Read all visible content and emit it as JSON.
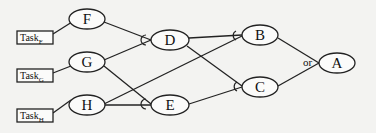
{
  "diagram": {
    "type": "and-or goal tree",
    "tasks": [
      {
        "id": "task_f",
        "label": "Task",
        "subscript": "F"
      },
      {
        "id": "task_g",
        "label": "Task",
        "subscript": "G"
      },
      {
        "id": "task_h",
        "label": "Task",
        "subscript": "H"
      }
    ],
    "nodes": {
      "F": "F",
      "G": "G",
      "H": "H",
      "D": "D",
      "E": "E",
      "B": "B",
      "C": "C",
      "A": "A"
    },
    "edges": [
      {
        "from": "Task_F",
        "to": "F"
      },
      {
        "from": "Task_G",
        "to": "G"
      },
      {
        "from": "Task_H",
        "to": "H"
      },
      {
        "from": "F",
        "to": "D",
        "join": "and"
      },
      {
        "from": "G",
        "to": "D",
        "join": "and"
      },
      {
        "from": "G",
        "to": "E",
        "join": "and"
      },
      {
        "from": "H",
        "to": "E",
        "join": "and"
      },
      {
        "from": "H",
        "to": "B",
        "join": "and"
      },
      {
        "from": "D",
        "to": "B",
        "join": "and"
      },
      {
        "from": "D",
        "to": "C",
        "join": "and"
      },
      {
        "from": "E",
        "to": "C",
        "join": "and"
      },
      {
        "from": "B",
        "to": "A",
        "join": "or"
      },
      {
        "from": "C",
        "to": "A",
        "join": "or"
      }
    ],
    "or_label": "or"
  }
}
